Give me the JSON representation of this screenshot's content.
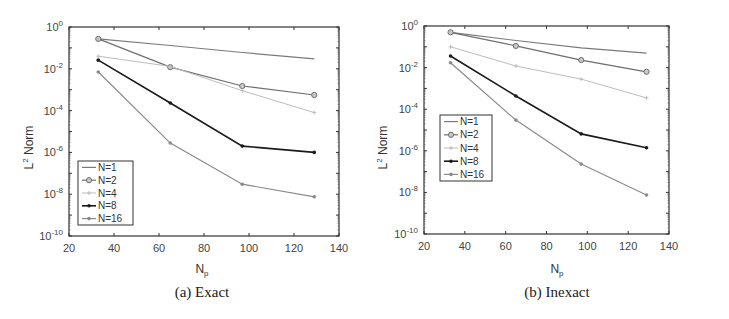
{
  "figure": {
    "panels": [
      {
        "caption": "(a) Exact",
        "xlabel_main": "N",
        "xlabel_sub": "p",
        "ylabel_main": "L",
        "ylabel_sup": "2",
        "ylabel_rest": " Norm"
      },
      {
        "caption": "(b) Inexact",
        "xlabel_main": "N",
        "xlabel_sub": "p",
        "ylabel_main": "L",
        "ylabel_sup": "2",
        "ylabel_rest": " Norm"
      }
    ]
  },
  "chart_data": [
    {
      "type": "line",
      "title": "(a) Exact",
      "xlabel": "N_p",
      "ylabel": "L^2 Norm",
      "yscale": "log",
      "xlim": [
        20,
        140
      ],
      "ylim": [
        1e-10,
        1
      ],
      "xticks": [
        20,
        40,
        60,
        80,
        100,
        120,
        140
      ],
      "yticks": [
        "10^-10",
        "10^-8",
        "10^-6",
        "10^-4",
        "10^-2",
        "10^0"
      ],
      "legend_position": "lower left",
      "x": [
        33,
        65,
        97,
        129
      ],
      "series": [
        {
          "name": "N=1",
          "values": [
            0.27,
            0.13,
            0.06,
            0.03
          ],
          "color": "#7a7a7a",
          "marker": "none",
          "width": 1.2
        },
        {
          "name": "N=2",
          "values": [
            0.27,
            0.012,
            0.0015,
            0.00056
          ],
          "color": "#6e6e6e",
          "marker": "circle",
          "width": 1.2
        },
        {
          "name": "N=4",
          "values": [
            0.04,
            0.013,
            0.0009,
            8e-05
          ],
          "color": "#bdbdbd",
          "marker": "plus",
          "width": 1.0
        },
        {
          "name": "N=8",
          "values": [
            0.026,
            0.00023,
            2e-06,
            1e-06
          ],
          "color": "#1a1a1a",
          "marker": "dot",
          "width": 1.6
        },
        {
          "name": "N=16",
          "values": [
            0.007,
            2.8e-06,
            3e-08,
            7.5e-09
          ],
          "color": "#8a8a8a",
          "marker": "dot",
          "width": 1.2
        }
      ]
    },
    {
      "type": "line",
      "title": "(b) Inexact",
      "xlabel": "N_p",
      "ylabel": "L^2 Norm",
      "yscale": "log",
      "xlim": [
        20,
        140
      ],
      "ylim": [
        1e-10,
        1
      ],
      "xticks": [
        20,
        40,
        60,
        80,
        100,
        120,
        140
      ],
      "yticks": [
        "10^-10",
        "10^-8",
        "10^-6",
        "10^-4",
        "10^-2",
        "10^0"
      ],
      "legend_position": "middle left",
      "x": [
        33,
        65,
        97,
        129
      ],
      "series": [
        {
          "name": "N=1",
          "values": [
            0.5,
            0.2,
            0.09,
            0.05
          ],
          "color": "#7a7a7a",
          "marker": "none",
          "width": 1.2
        },
        {
          "name": "N=2",
          "values": [
            0.5,
            0.11,
            0.023,
            0.0063
          ],
          "color": "#6e6e6e",
          "marker": "circle",
          "width": 1.2
        },
        {
          "name": "N=4",
          "values": [
            0.1,
            0.012,
            0.0028,
            0.00035
          ],
          "color": "#bdbdbd",
          "marker": "plus",
          "width": 1.0
        },
        {
          "name": "N=8",
          "values": [
            0.036,
            0.00043,
            6.5e-06,
            1.4e-06
          ],
          "color": "#1a1a1a",
          "marker": "dot",
          "width": 1.6
        },
        {
          "name": "N=16",
          "values": [
            0.017,
            3e-05,
            2.3e-07,
            7.5e-09
          ],
          "color": "#8a8a8a",
          "marker": "dot",
          "width": 1.2
        }
      ]
    }
  ]
}
